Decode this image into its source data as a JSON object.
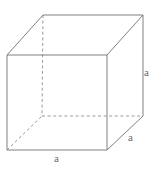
{
  "figure": {
    "kind": "cube-net-diagram",
    "canvas": {
      "width": 157,
      "height": 173,
      "background": "#ffffff"
    },
    "style": {
      "edge_color": "#808080",
      "hidden_edge_color": "#9a9a9a",
      "label_color": "#6b6b6b",
      "stroke_width": 1,
      "dash_pattern": "3 2.6"
    },
    "vertices": {
      "front_top_left": {
        "x": 7,
        "y": 55
      },
      "front_top_right": {
        "x": 107,
        "y": 55
      },
      "front_bottom_right": {
        "x": 107,
        "y": 150
      },
      "front_bottom_left": {
        "x": 7,
        "y": 150
      },
      "back_top_left": {
        "x": 43,
        "y": 15
      },
      "back_top_right": {
        "x": 143,
        "y": 15
      },
      "back_bottom_right": {
        "x": 143,
        "y": 116
      },
      "back_bottom_left": {
        "x": 42,
        "y": 116
      }
    },
    "edges": {
      "visible": [
        {
          "name": "front-top",
          "from": "front_top_left",
          "to": "front_top_right"
        },
        {
          "name": "front-right",
          "from": "front_top_right",
          "to": "front_bottom_right"
        },
        {
          "name": "front-bottom",
          "from": "front_bottom_right",
          "to": "front_bottom_left"
        },
        {
          "name": "front-left",
          "from": "front_bottom_left",
          "to": "front_top_left"
        },
        {
          "name": "back-top",
          "from": "back_top_left",
          "to": "back_top_right"
        },
        {
          "name": "back-right",
          "from": "back_top_right",
          "to": "back_bottom_right"
        },
        {
          "name": "connector-top-left",
          "from": "front_top_left",
          "to": "back_top_left"
        },
        {
          "name": "connector-top-right",
          "from": "front_top_right",
          "to": "back_top_right"
        },
        {
          "name": "connector-bottom-right",
          "from": "front_bottom_right",
          "to": "back_bottom_right"
        }
      ],
      "hidden": [
        {
          "name": "back-left",
          "from": "back_top_left",
          "to": "back_bottom_left"
        },
        {
          "name": "back-bottom",
          "from": "back_bottom_left",
          "to": "back_bottom_right"
        },
        {
          "name": "connector-bottom-left",
          "from": "front_bottom_left",
          "to": "back_bottom_left"
        }
      ]
    },
    "labels": {
      "height": "a",
      "depth": "a",
      "width": "a"
    }
  }
}
